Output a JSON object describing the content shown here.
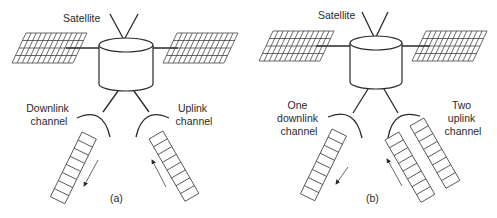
{
  "diagram": {
    "panels": [
      {
        "id": "a",
        "caption": "(a)",
        "satellite_label": "Satellite",
        "downlink_label_lines": [
          "Downlink",
          "channel"
        ],
        "uplink_label_lines": [
          "Uplink",
          "channel"
        ],
        "downlink_channels": 1,
        "uplink_channels": 1,
        "cells_per_channel": 8
      },
      {
        "id": "b",
        "caption": "(b)",
        "satellite_label": "Satellite",
        "downlink_label_lines": [
          "One",
          "downlink",
          "channel"
        ],
        "uplink_label_lines": [
          "Two",
          "uplink",
          "channel"
        ],
        "downlink_channels": 1,
        "uplink_channels": 2,
        "cells_per_channel": 8
      }
    ],
    "colors": {
      "stroke": "#2a2a2a",
      "background": "#ffffff"
    }
  }
}
